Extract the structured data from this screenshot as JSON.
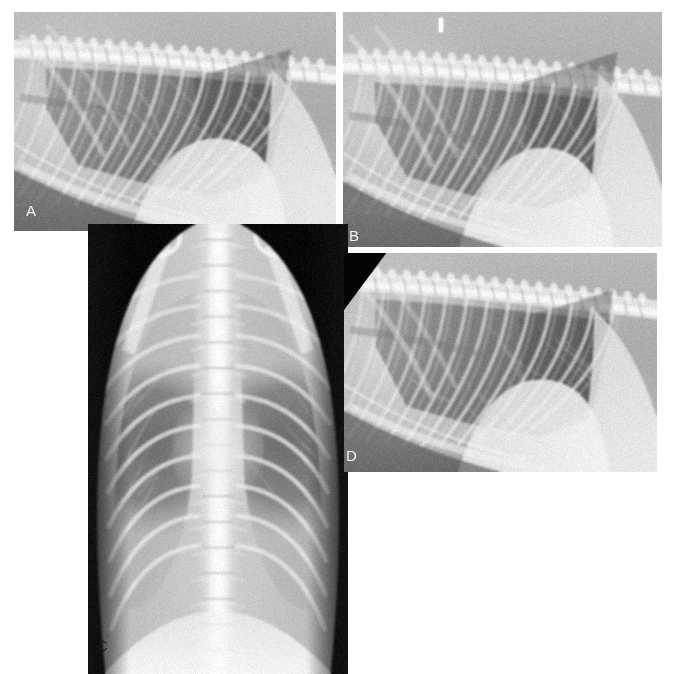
{
  "figure": {
    "background_color": "#ffffff",
    "width": 676,
    "height": 674,
    "modality": "radiograph",
    "panel_count": 4
  },
  "panels": [
    {
      "id": "a",
      "label": "A",
      "label_color": "#f2f2f2",
      "label_style": "light",
      "view": "right-lateral-thorax",
      "description": "Lateral thoracic radiograph showing thoracic spine, ribs, cardiac silhouette and aerated lung fields",
      "x": 14,
      "y": 12,
      "width": 322,
      "height": 219,
      "background_color": "#9a9a9a"
    },
    {
      "id": "b",
      "label": "B",
      "label_color": "#f2f2f2",
      "label_style": "light",
      "view": "right-lateral-thorax",
      "description": "Lateral thoracic radiograph with small radiopaque marker artifact at cranial dorsal margin",
      "x": 343,
      "y": 12,
      "width": 319,
      "height": 235,
      "background_color": "#9a9a9a",
      "has_marker": true
    },
    {
      "id": "c",
      "label": "C",
      "label_color": "#1a1a1a",
      "label_style": "dark",
      "view": "ventrodorsal-thorax",
      "description": "Ventrodorsal thoracic radiograph showing symmetric rib cage, vertebral column and sternum superimposed in midline",
      "x": 88,
      "y": 224,
      "width": 260,
      "height": 450,
      "background_color": "#8f8f8f"
    },
    {
      "id": "d",
      "label": "D",
      "label_color": "#f2f2f2",
      "label_style": "light",
      "view": "right-lateral-thorax",
      "description": "Lateral thoracic radiograph with black collimation corner at cranial dorsal aspect",
      "x": 344,
      "y": 253,
      "width": 313,
      "height": 219,
      "background_color": "#9a9a9a",
      "has_black_corner": true
    }
  ],
  "colors": {
    "page_background": "#ffffff",
    "film_mid_gray": "#9a9a9a",
    "lung_field_dark": "#6b6b6b",
    "bone_bright": "#e8e8e8",
    "soft_tissue": "#b8b8b8",
    "collimation_black": "#050505",
    "label_light": "#f2f2f2",
    "label_dark": "#1a1a1a"
  }
}
